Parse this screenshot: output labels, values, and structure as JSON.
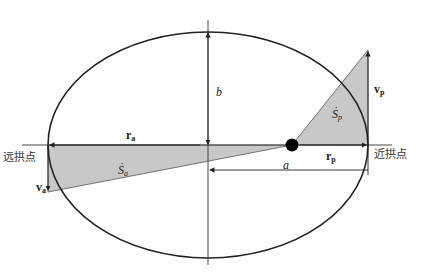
{
  "diagram": {
    "labels": {
      "aphelion": "远拱点",
      "perihelion": "近拱点",
      "semi_major": "a",
      "semi_minor": "b",
      "r_aphelion": "r",
      "r_aphelion_sub": "a",
      "r_perihelion": "r",
      "r_perihelion_sub": "p",
      "v_aphelion": "v",
      "v_aphelion_sub": "a",
      "v_perihelion": "v",
      "v_perihelion_sub": "p",
      "area_rate_aphelion": "Ṡ",
      "area_rate_aphelion_sub": "a",
      "area_rate_perihelion": "Ṡ",
      "area_rate_perihelion_sub": "p"
    },
    "colors": {
      "shade": "#c8c8c8",
      "line": "#222222",
      "focus": "#000000"
    }
  }
}
